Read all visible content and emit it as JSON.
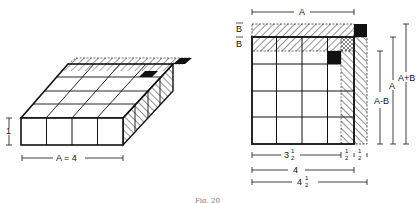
{
  "figure": {
    "caption": "Fig. 20",
    "colors": {
      "ink": "#111111",
      "paper": "#ffffff",
      "caption": "#777777"
    }
  },
  "left_figure": {
    "description": "Isometric slab of 4x4 unit cubes with hatched strips of thickness B along back and right edges",
    "width_label": "A = 4",
    "height_label": "1",
    "grid_cells": 4
  },
  "right_figure": {
    "description": "Top view of square of side A with hatched strips of width B on top and right, black corner squares",
    "top_label": "A",
    "left_labels": [
      "B",
      "B"
    ],
    "right_labels": [
      "A-B",
      "A",
      "A+B"
    ],
    "bottom_labels": {
      "row1": [
        "3 1/2",
        "1/2",
        "1/2"
      ],
      "row2": "4",
      "row3": "4 1/2"
    },
    "frac_num": "1",
    "frac_den": "2",
    "three": "3",
    "four": "4"
  }
}
